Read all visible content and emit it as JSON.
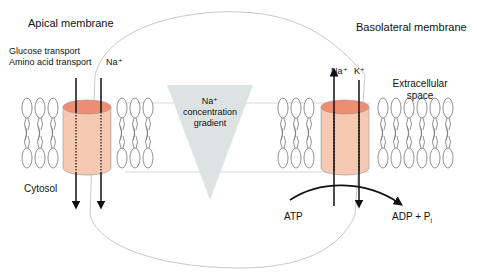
{
  "labels": {
    "apical_membrane": "Apical membrane",
    "basolateral_membrane": "Basolateral membrane",
    "glucose_transport": "Glucose transport",
    "amino_acid_transport": "Amino acid transport",
    "na_left": "Na⁺",
    "na_right": "Na⁺",
    "k_right": "K⁺",
    "extracellular_line1": "Extracellular",
    "extracellular_line2": "space",
    "gradient_line1": "Na⁺",
    "gradient_line2": "concentration",
    "gradient_line3": "gradient",
    "cytosol": "Cytosol",
    "atp": "ATP",
    "adp": "ADP + P",
    "adp_sub": "i"
  },
  "colors": {
    "channel_fill": "#f6c9b3",
    "channel_top": "#ee8d72",
    "gradient_fill": "#dde3e3",
    "cell_outline": "#c8c8c8",
    "lipid_stroke": "#777777",
    "arrow": "#111111"
  }
}
